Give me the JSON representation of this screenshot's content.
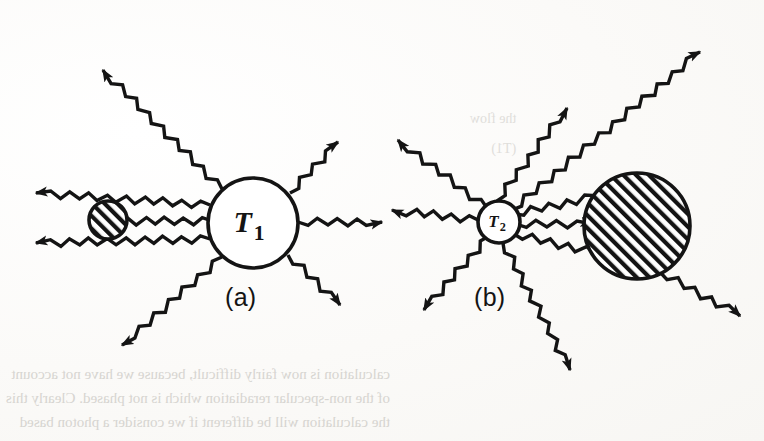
{
  "figure": {
    "kind": "two-panel radiative exchange diagram",
    "background_color": "#fbfbf9",
    "ink_color": "#141414",
    "panels": [
      {
        "id": "a",
        "label": "(a)",
        "label_x": 225,
        "label_y": 283,
        "emitter": {
          "name": "T1-circle",
          "label": "T",
          "subscript": "1",
          "cx": 253,
          "cy": 223,
          "r": 45,
          "fill": "#ffffff",
          "hatched": false
        },
        "absorber": {
          "name": "small-hatched-disk",
          "cx": 108,
          "cy": 220,
          "r": 19,
          "hatched": true
        },
        "rays": [
          {
            "name": "ray-up-left",
            "x1": 222,
            "y1": 189,
            "x2": 103,
            "y2": 70,
            "arrow": "end"
          },
          {
            "name": "ray-up-right",
            "x1": 290,
            "y1": 193,
            "x2": 338,
            "y2": 142,
            "arrow": "end"
          },
          {
            "name": "ray-left-upper",
            "x1": 210,
            "y1": 205,
            "x2": 36,
            "y2": 193,
            "arrow": "end"
          },
          {
            "name": "ray-left-middle",
            "x1": 212,
            "y1": 221,
            "x2": 112,
            "y2": 221,
            "arrow": "end"
          },
          {
            "name": "ray-left-lower",
            "x1": 210,
            "y1": 239,
            "x2": 36,
            "y2": 243,
            "arrow": "end"
          },
          {
            "name": "ray-right",
            "x1": 298,
            "y1": 222,
            "x2": 382,
            "y2": 222,
            "arrow": "end"
          },
          {
            "name": "ray-down-left",
            "x1": 222,
            "y1": 257,
            "x2": 122,
            "y2": 345,
            "arrow": "end"
          },
          {
            "name": "ray-down-right",
            "x1": 288,
            "y1": 255,
            "x2": 340,
            "y2": 305,
            "arrow": "end"
          }
        ]
      },
      {
        "id": "b",
        "label": "(b)",
        "label_x": 474,
        "label_y": 283,
        "emitter": {
          "name": "T2-circle",
          "label": "T",
          "subscript": "2",
          "cx": 499,
          "cy": 222,
          "r": 21,
          "fill": "#ffffff",
          "hatched": false
        },
        "absorber": {
          "name": "large-hatched-disk",
          "cx": 637,
          "cy": 226,
          "r": 53,
          "hatched": true
        },
        "rays": [
          {
            "name": "ray-up-left",
            "x1": 487,
            "y1": 208,
            "x2": 398,
            "y2": 140,
            "arrow": "end"
          },
          {
            "name": "ray-up-center",
            "x1": 497,
            "y1": 201,
            "x2": 567,
            "y2": 108,
            "arrow": "end"
          },
          {
            "name": "ray-up-right",
            "x1": 512,
            "y1": 210,
            "x2": 700,
            "y2": 52,
            "arrow": "end"
          },
          {
            "name": "ray-left",
            "x1": 478,
            "y1": 220,
            "x2": 392,
            "y2": 210,
            "arrow": "end"
          },
          {
            "name": "ray-inner-upper",
            "x1": 514,
            "y1": 214,
            "x2": 600,
            "y2": 196,
            "arrow": "none"
          },
          {
            "name": "ray-inner-middle",
            "x1": 516,
            "y1": 224,
            "x2": 592,
            "y2": 224,
            "arrow": "end"
          },
          {
            "name": "ray-inner-lower",
            "x1": 514,
            "y1": 234,
            "x2": 600,
            "y2": 254,
            "arrow": "none"
          },
          {
            "name": "ray-down-left",
            "x1": 489,
            "y1": 236,
            "x2": 424,
            "y2": 310,
            "arrow": "end"
          },
          {
            "name": "ray-down-center",
            "x1": 503,
            "y1": 243,
            "x2": 570,
            "y2": 370,
            "arrow": "end"
          },
          {
            "name": "ray-down-right",
            "x1": 660,
            "y1": 272,
            "x2": 740,
            "y2": 316,
            "arrow": "end"
          }
        ]
      }
    ]
  },
  "ghost_text": {
    "description": "faint bleed-through text from the reverse of the scanned page",
    "bottom_lines": [
      "calculation is now fairly difficult, because we have not account",
      "of the non-specular reradiation which is not phased. Clearly this",
      "the calculation will be different if we consider a photon based"
    ],
    "right_lines": [
      "the flow",
      "(T1)"
    ]
  }
}
